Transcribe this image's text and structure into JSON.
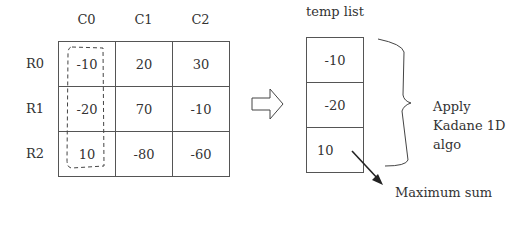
{
  "matrix": {
    "column_headers": [
      "C0",
      "C1",
      "C2"
    ],
    "row_headers": [
      "R0",
      "R1",
      "R2"
    ],
    "rows": [
      [
        "-10",
        "20",
        "30"
      ],
      [
        "-20",
        "70",
        "-10"
      ],
      [
        "10",
        "-80",
        "-60"
      ]
    ],
    "highlighted_column": "C0"
  },
  "temp_list": {
    "title": "temp list",
    "values": [
      "-10",
      "-20",
      "10"
    ]
  },
  "annotations": {
    "brace_label_line1": "Apply",
    "brace_label_line2": "Kadane 1D",
    "brace_label_line3": "algo",
    "arrow_label": "Maximum sum"
  },
  "icons": {
    "transform_arrow": "hollow-right-arrow",
    "result_arrow": "diagonal-arrow"
  }
}
